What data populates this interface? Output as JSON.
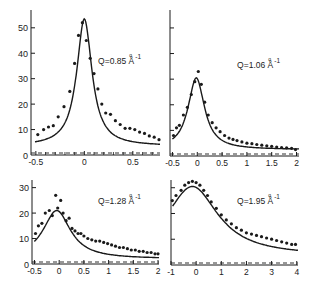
{
  "figure": {
    "ink_color": "#1a1a1a",
    "background": "#ffffff"
  },
  "chart_data": [
    {
      "type": "scatter",
      "panel": "top-left",
      "title": "Q=0.85 Å⁻¹",
      "label_main": "Q=0.85 Å",
      "label_sup": "-1",
      "xlabel": "",
      "ylabel": "",
      "xlim": [
        -0.55,
        0.78
      ],
      "ylim": [
        0,
        57
      ],
      "xticks": [
        -0.5,
        0,
        0.5
      ],
      "xtick_labels": [
        "-0.5",
        "0",
        "0.5"
      ],
      "xminor": [
        -0.4,
        -0.3,
        -0.2,
        -0.1,
        0.1,
        0.2,
        0.3,
        0.4,
        0.6,
        0.7
      ],
      "yticks": [
        0,
        10,
        20,
        30,
        40,
        50
      ],
      "ytick_labels": [
        "0",
        "10",
        "20",
        "30",
        "40",
        "50"
      ],
      "show_ytick_labels": true,
      "series": [
        {
          "name": "data",
          "kind": "points",
          "x": [
            -0.48,
            -0.42,
            -0.37,
            -0.32,
            -0.27,
            -0.21,
            -0.15,
            -0.1,
            -0.06,
            -0.02,
            0.02,
            0.06,
            0.1,
            0.14,
            0.18,
            0.22,
            0.27,
            0.32,
            0.37,
            0.42,
            0.47,
            0.52,
            0.57,
            0.62,
            0.67,
            0.72,
            0.77
          ],
          "y": [
            8,
            10,
            11,
            11.5,
            15,
            19,
            25,
            36,
            47,
            52,
            45,
            38,
            32,
            26,
            20,
            16.5,
            16,
            13.5,
            12,
            10.5,
            10.5,
            10,
            9,
            8.5,
            7.5,
            7,
            6
          ]
        },
        {
          "name": "fit",
          "kind": "line",
          "model": "lorentzian",
          "params": {
            "amplitude": 50,
            "center": 0.0,
            "hwhm": 0.095,
            "background": 3.5,
            "slope": 6
          }
        }
      ]
    },
    {
      "type": "scatter",
      "panel": "top-right",
      "title": "Q=1.06 Å⁻¹",
      "label_main": "Q=1.06 Å",
      "label_sup": "-1",
      "xlabel": "",
      "ylabel": "",
      "xlim": [
        -0.55,
        2.05
      ],
      "ylim": [
        0,
        57
      ],
      "xticks": [
        -0.5,
        0,
        0.5,
        1,
        1.5,
        2
      ],
      "xtick_labels": [
        "-0.5",
        "0",
        "0.5",
        "1",
        "1.5",
        "2"
      ],
      "xminor": [],
      "yticks": [
        0,
        10,
        20,
        30,
        40,
        50
      ],
      "ytick_labels": [
        "",
        "",
        "",
        "",
        "",
        ""
      ],
      "show_ytick_labels": false,
      "series": [
        {
          "name": "data",
          "kind": "points",
          "x": [
            -0.48,
            -0.42,
            -0.36,
            -0.28,
            -0.2,
            -0.12,
            -0.05,
            0.02,
            0.08,
            0.15,
            0.22,
            0.3,
            0.38,
            0.46,
            0.55,
            0.64,
            0.72,
            0.8,
            0.9,
            1.0,
            1.1,
            1.2,
            1.3,
            1.4,
            1.5,
            1.6,
            1.7,
            1.8,
            1.9,
            1.98
          ],
          "y": [
            8,
            11,
            12,
            16,
            19,
            24,
            29,
            33,
            28,
            21,
            16,
            13,
            11,
            9.5,
            8,
            7,
            6.5,
            6,
            5.5,
            5,
            4.8,
            4.5,
            4.2,
            4,
            3.8,
            3.5,
            3.3,
            3.2,
            3,
            2.5
          ]
        },
        {
          "name": "fit",
          "kind": "line",
          "model": "lorentzian",
          "params": {
            "amplitude": 28,
            "center": -0.02,
            "hwhm": 0.2,
            "background": 2.5,
            "slope": 6
          }
        }
      ]
    },
    {
      "type": "scatter",
      "panel": "bottom-left",
      "title": "Q=1.28 Å⁻¹",
      "label_main": "Q=1.28 Å",
      "label_sup": "-1",
      "xlabel": "",
      "ylabel": "",
      "xlim": [
        -0.55,
        2.02
      ],
      "ylim": [
        0,
        33
      ],
      "xticks": [
        -0.5,
        0,
        0.5,
        1,
        1.5,
        2
      ],
      "xtick_labels": [
        "-0.5",
        "0",
        "0.5",
        "1",
        "1.5",
        "2"
      ],
      "xminor": [],
      "yticks": [
        0,
        10,
        20,
        30
      ],
      "ytick_labels": [
        "0",
        "10",
        "20",
        "30"
      ],
      "show_ytick_labels": true,
      "series": [
        {
          "name": "data",
          "kind": "points",
          "x": [
            -0.48,
            -0.42,
            -0.35,
            -0.28,
            -0.2,
            -0.14,
            -0.07,
            -0.03,
            0.03,
            0.08,
            0.14,
            0.2,
            0.26,
            0.32,
            0.38,
            0.44,
            0.5,
            0.58,
            0.66,
            0.74,
            0.82,
            0.9,
            0.98,
            1.06,
            1.14,
            1.22,
            1.3,
            1.38,
            1.46,
            1.54,
            1.62,
            1.7,
            1.78,
            1.86,
            1.94,
            2.0
          ],
          "y": [
            12,
            15,
            16,
            20,
            21,
            19,
            27,
            22,
            25,
            20,
            17,
            18,
            14,
            13,
            12,
            12,
            11,
            10,
            9.5,
            9,
            9,
            8.5,
            8,
            7.5,
            7,
            6.5,
            6.5,
            6,
            5.5,
            5.5,
            5,
            5,
            4.5,
            4.5,
            4,
            4
          ]
        },
        {
          "name": "fit",
          "kind": "line",
          "model": "lorentzian",
          "params": {
            "amplitude": 19,
            "center": -0.05,
            "hwhm": 0.34,
            "background": 2,
            "slope": 1.5
          }
        }
      ]
    },
    {
      "type": "scatter",
      "panel": "bottom-right",
      "title": "Q=1.95 Å⁻¹",
      "label_main": "Q=1.95 Å",
      "label_sup": "-1",
      "xlabel": "",
      "ylabel": "",
      "xlim": [
        -1,
        4.05
      ],
      "ylim": [
        0,
        33
      ],
      "xticks": [
        -1,
        0,
        1,
        2,
        3,
        4
      ],
      "xtick_labels": [
        "-1",
        "0",
        "1",
        "2",
        "3",
        "4"
      ],
      "xminor": [],
      "yticks": [
        10,
        20,
        30
      ],
      "ytick_labels": [
        "",
        "",
        ""
      ],
      "show_ytick_labels": false,
      "series": [
        {
          "name": "data",
          "kind": "points",
          "x": [
            -0.95,
            -0.8,
            -0.6,
            -0.45,
            -0.3,
            -0.15,
            0.0,
            0.15,
            0.3,
            0.45,
            0.6,
            0.8,
            1.0,
            1.2,
            1.4,
            1.6,
            1.8,
            2.0,
            2.2,
            2.4,
            2.6,
            2.8,
            3.0,
            3.2,
            3.4,
            3.6,
            3.8,
            3.95
          ],
          "y": [
            25,
            27,
            29,
            31,
            32,
            32.5,
            32,
            31,
            29,
            27,
            24.5,
            22,
            19.5,
            17.5,
            16,
            14.5,
            13.5,
            12.5,
            12,
            11.5,
            11,
            10.5,
            10,
            9.5,
            9,
            8.5,
            8,
            8
          ]
        },
        {
          "name": "fit",
          "kind": "line",
          "model": "lorentzian",
          "params": {
            "amplitude": 27,
            "center": -0.15,
            "hwhm": 1.25,
            "background": 3.5,
            "slope": 0
          }
        }
      ]
    }
  ],
  "panels_layout": [
    {
      "x0": 31,
      "x1": 160,
      "y_top": 10,
      "y_zero": 155
    },
    {
      "x0": 170,
      "x1": 299,
      "y_top": 10,
      "y_zero": 156
    },
    {
      "x0": 32,
      "x1": 159,
      "y_top": 180,
      "y_zero": 264
    },
    {
      "x0": 171,
      "x1": 298,
      "y_top": 180,
      "y_zero": 265
    }
  ]
}
